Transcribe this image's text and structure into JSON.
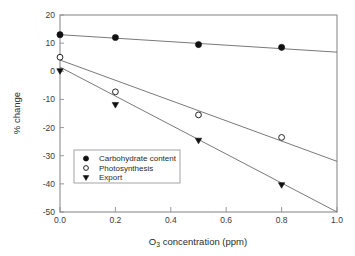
{
  "chart_data": {
    "type": "scatter",
    "title": "",
    "xlabel": "O3 concentration (ppm)",
    "xlabel_base": "O",
    "xlabel_sub": "3",
    "xlabel_rest": " concentration (ppm)",
    "ylabel": "% change",
    "xlim": [
      0.0,
      1.0
    ],
    "ylim": [
      -50,
      20
    ],
    "grid": false,
    "legend_position": "inside-lower-left",
    "x_ticks": [
      0.0,
      0.2,
      0.4,
      0.6,
      0.8,
      1.0
    ],
    "x_tick_labels": [
      "0.0",
      "0.2",
      "0.4",
      "0.6",
      "0.8",
      "1.0"
    ],
    "y_ticks": [
      20,
      10,
      0,
      -10,
      -20,
      -30,
      -40,
      -50
    ],
    "y_tick_labels": [
      "20",
      "10",
      "0",
      "-10",
      "-20",
      "-30",
      "-40",
      "-50"
    ],
    "series": [
      {
        "name": "Carbohydrate content",
        "marker": "filled-circle",
        "x": [
          0.0,
          0.2,
          0.5,
          0.8
        ],
        "values": [
          13.0,
          12.0,
          9.5,
          8.5
        ],
        "trend_line": {
          "x": [
            0.0,
            1.0
          ],
          "y": [
            13.0,
            6.8
          ]
        }
      },
      {
        "name": "Photosynthesis",
        "marker": "open-circle",
        "x": [
          0.0,
          0.2,
          0.5,
          0.8
        ],
        "values": [
          5.0,
          -7.3,
          -15.5,
          -23.5
        ],
        "trend_line": {
          "x": [
            0.0,
            1.0
          ],
          "y": [
            4.0,
            -32.0
          ]
        }
      },
      {
        "name": "Export",
        "marker": "filled-triangle-down",
        "x": [
          0.0,
          0.2,
          0.5,
          0.8
        ],
        "values": [
          0.0,
          -12.0,
          -24.7,
          -40.5
        ],
        "trend_line": {
          "x": [
            0.0,
            1.0
          ],
          "y": [
            1.5,
            -50.0
          ]
        }
      }
    ],
    "colors": {
      "axis": "#8d8d8d",
      "line": "#6a6a6a",
      "marker_fill": "#111111",
      "marker_open_fill": "#ffffff",
      "text": "#2b2b2b",
      "background": "#ffffff"
    }
  },
  "legend": {
    "entries": [
      {
        "label": "Carbohydrate content",
        "marker": "filled-circle"
      },
      {
        "label": "Photosynthesis",
        "marker": "open-circle"
      },
      {
        "label": "Export",
        "marker": "filled-triangle-down"
      }
    ]
  }
}
